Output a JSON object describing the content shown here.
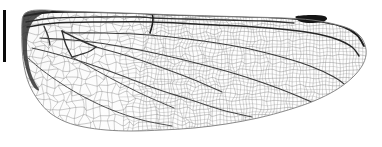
{
  "figure": {
    "name": "dragonfly-wing-specimen",
    "orientation": "base at left, apex at right, leading edge up",
    "width": 382,
    "height": 147,
    "background_color": "#ffffff"
  },
  "scale_bar": {
    "name": "scale-bar",
    "orientation": "vertical",
    "color": "#0a0a0a",
    "x": 3,
    "y": 10,
    "width": 3,
    "height": 52,
    "label": ""
  },
  "wing": {
    "name": "wing-membrane",
    "membrane_fill": "#fbfbfb",
    "membrane_opacity": 0.55,
    "outline_color": "#7d7d7d",
    "base_x": 22,
    "apex_x": 366,
    "top_y": 10,
    "bottom_y": 131,
    "outline": [
      [
        22,
        22
      ],
      [
        24,
        15
      ],
      [
        30,
        11
      ],
      [
        42,
        10
      ],
      [
        62,
        11
      ],
      [
        92,
        12
      ],
      [
        124,
        13
      ],
      [
        150,
        14
      ],
      [
        178,
        15
      ],
      [
        214,
        16
      ],
      [
        250,
        17
      ],
      [
        284,
        18
      ],
      [
        312,
        20
      ],
      [
        334,
        24
      ],
      [
        350,
        29
      ],
      [
        360,
        36
      ],
      [
        365,
        45
      ],
      [
        366,
        55
      ],
      [
        362,
        66
      ],
      [
        352,
        78
      ],
      [
        336,
        90
      ],
      [
        314,
        101
      ],
      [
        288,
        110
      ],
      [
        258,
        118
      ],
      [
        226,
        124
      ],
      [
        194,
        128
      ],
      [
        162,
        130
      ],
      [
        132,
        131
      ],
      [
        106,
        130
      ],
      [
        84,
        127
      ],
      [
        66,
        122
      ],
      [
        50,
        113
      ],
      [
        38,
        100
      ],
      [
        29,
        84
      ],
      [
        24,
        66
      ],
      [
        22,
        46
      ],
      [
        22,
        22
      ]
    ]
  },
  "pterostigma": {
    "name": "pterostigma",
    "color": "#151515",
    "points": [
      [
        297,
        16
      ],
      [
        312,
        15
      ],
      [
        324,
        16
      ],
      [
        327,
        19
      ],
      [
        322,
        22
      ],
      [
        308,
        23
      ],
      [
        299,
        21
      ],
      [
        296,
        18
      ]
    ]
  },
  "basal_shading": {
    "name": "basal-dark-margin",
    "color": "#2a2a2a",
    "points": [
      [
        22,
        22
      ],
      [
        24,
        14
      ],
      [
        31,
        11
      ],
      [
        43,
        10
      ],
      [
        50,
        11
      ],
      [
        42,
        14
      ],
      [
        34,
        20
      ],
      [
        29,
        30
      ],
      [
        27,
        44
      ],
      [
        28,
        60
      ],
      [
        32,
        76
      ],
      [
        39,
        90
      ],
      [
        33,
        86
      ],
      [
        27,
        72
      ],
      [
        23,
        54
      ],
      [
        22,
        36
      ]
    ]
  },
  "major_veins": [
    {
      "name": "costa-leading-edge",
      "width": 1.9,
      "color": "#1c1c1c",
      "points": [
        [
          24,
          16
        ],
        [
          52,
          12
        ],
        [
          96,
          12
        ],
        [
          140,
          13
        ],
        [
          152,
          14
        ],
        [
          186,
          15
        ],
        [
          228,
          16
        ],
        [
          268,
          17
        ],
        [
          298,
          19
        ],
        [
          324,
          22
        ],
        [
          344,
          27
        ],
        [
          357,
          35
        ],
        [
          364,
          46
        ]
      ]
    },
    {
      "name": "subcosta",
      "width": 1.3,
      "color": "#303030",
      "points": [
        [
          26,
          22
        ],
        [
          54,
          18
        ],
        [
          98,
          17
        ],
        [
          140,
          17
        ],
        [
          152,
          18
        ],
        [
          186,
          19
        ],
        [
          226,
          20
        ],
        [
          264,
          21
        ],
        [
          294,
          23
        ]
      ]
    },
    {
      "name": "radius-anterior",
      "width": 1.5,
      "color": "#262626",
      "points": [
        [
          27,
          27
        ],
        [
          56,
          23
        ],
        [
          100,
          22
        ],
        [
          152,
          22
        ],
        [
          196,
          24
        ],
        [
          240,
          26
        ],
        [
          280,
          29
        ],
        [
          312,
          33
        ],
        [
          336,
          39
        ],
        [
          352,
          47
        ],
        [
          359,
          56
        ]
      ]
    },
    {
      "name": "nodus-crossvein",
      "width": 1.6,
      "color": "#1a1a1a",
      "points": [
        [
          152,
          13
        ],
        [
          153,
          19
        ],
        [
          152,
          26
        ],
        [
          150,
          33
        ]
      ]
    },
    {
      "name": "radial-sector-rs",
      "width": 1.2,
      "color": "#383838",
      "points": [
        [
          66,
          33
        ],
        [
          104,
          33
        ],
        [
          150,
          35
        ],
        [
          196,
          40
        ],
        [
          240,
          47
        ],
        [
          278,
          56
        ],
        [
          310,
          66
        ],
        [
          334,
          77
        ],
        [
          348,
          87
        ]
      ]
    },
    {
      "name": "media-posterior",
      "width": 1.2,
      "color": "#3c3c3c",
      "points": [
        [
          40,
          38
        ],
        [
          72,
          40
        ],
        [
          112,
          45
        ],
        [
          154,
          53
        ],
        [
          196,
          63
        ],
        [
          236,
          74
        ],
        [
          272,
          86
        ],
        [
          300,
          97
        ],
        [
          320,
          106
        ]
      ]
    },
    {
      "name": "cubitus",
      "width": 1.1,
      "color": "#444444",
      "points": [
        [
          32,
          48
        ],
        [
          56,
          54
        ],
        [
          86,
          63
        ],
        [
          120,
          75
        ],
        [
          154,
          88
        ],
        [
          188,
          99
        ],
        [
          222,
          110
        ],
        [
          252,
          117
        ]
      ]
    },
    {
      "name": "anal-vein",
      "width": 1.0,
      "color": "#4c4c4c",
      "points": [
        [
          28,
          58
        ],
        [
          42,
          70
        ],
        [
          62,
          84
        ],
        [
          86,
          98
        ],
        [
          112,
          110
        ],
        [
          142,
          120
        ],
        [
          172,
          126
        ]
      ]
    },
    {
      "name": "triangle-upper",
      "width": 1.4,
      "color": "#2e2e2e",
      "points": [
        [
          62,
          31
        ],
        [
          80,
          40
        ],
        [
          96,
          47
        ]
      ]
    },
    {
      "name": "triangle-lower",
      "width": 1.4,
      "color": "#2e2e2e",
      "points": [
        [
          62,
          31
        ],
        [
          66,
          45
        ],
        [
          72,
          57
        ]
      ]
    },
    {
      "name": "triangle-base",
      "width": 1.3,
      "color": "#333333",
      "points": [
        [
          72,
          57
        ],
        [
          88,
          52
        ],
        [
          96,
          47
        ]
      ]
    },
    {
      "name": "arculus",
      "width": 1.3,
      "color": "#343434",
      "points": [
        [
          44,
          26
        ],
        [
          48,
          36
        ],
        [
          50,
          45
        ]
      ]
    },
    {
      "name": "discoidal-branch",
      "width": 1.1,
      "color": "#414141",
      "points": [
        [
          96,
          47
        ],
        [
          128,
          56
        ],
        [
          160,
          67
        ],
        [
          192,
          79
        ],
        [
          222,
          92
        ]
      ]
    },
    {
      "name": "posterior-branch",
      "width": 1.0,
      "color": "#4a4a4a",
      "points": [
        [
          72,
          57
        ],
        [
          92,
          68
        ],
        [
          116,
          81
        ],
        [
          144,
          95
        ],
        [
          174,
          108
        ]
      ]
    }
  ],
  "venation_mesh": {
    "name": "cell-network",
    "vein_color": "#6e6e6e",
    "vein_width": 0.5,
    "description": "dense polygonal cell mesh, coarse at base, fine toward apex",
    "row_count": 16,
    "col_count": 52,
    "cell_seed": 20250414
  }
}
